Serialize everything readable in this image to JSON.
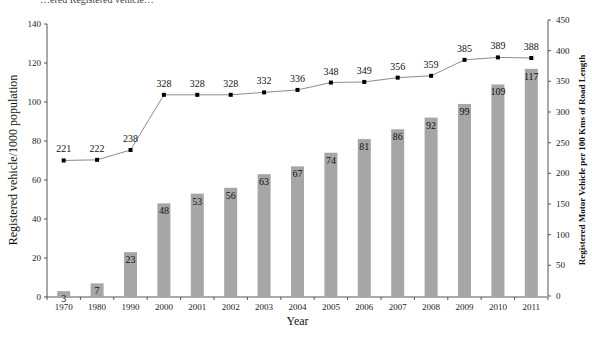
{
  "header_fragment": "…ered Registered vehicle…",
  "chart_data": {
    "type": "bar",
    "categories": [
      "1970",
      "1980",
      "1990",
      "2000",
      "2001",
      "2002",
      "2003",
      "2004",
      "2005",
      "2006",
      "2007",
      "2008",
      "2009",
      "2010",
      "2011"
    ],
    "series": [
      {
        "name": "Registered vehicle/1000 population",
        "kind": "bar",
        "axis": "left",
        "values": [
          3,
          7,
          23,
          48,
          53,
          56,
          63,
          67,
          74,
          81,
          86,
          92,
          99,
          109,
          117
        ]
      },
      {
        "name": "Registered Motor Vehicle per 100 Kms of Road Length",
        "kind": "line",
        "axis": "right",
        "values": [
          221,
          222,
          238,
          328,
          328,
          328,
          332,
          336,
          348,
          349,
          356,
          359,
          385,
          389,
          388
        ]
      }
    ],
    "title": "",
    "xlabel": "Year",
    "ylabel": "Registered vehicle/1000 population",
    "ylabel_right": "Registered Motor Vehicle per 100 Kms of Road Length",
    "ylim": [
      0,
      140
    ],
    "yticks": [
      0,
      20,
      40,
      60,
      80,
      100,
      120,
      140
    ],
    "ylim_right": [
      0,
      450
    ],
    "yticks_right": [
      0,
      50,
      100,
      150,
      200,
      250,
      300,
      350,
      400,
      450
    ],
    "grid": false,
    "legend": "none",
    "colors": {
      "bar": "#a6a6a6",
      "line": "#8c8c8c",
      "marker": "#000000"
    }
  }
}
